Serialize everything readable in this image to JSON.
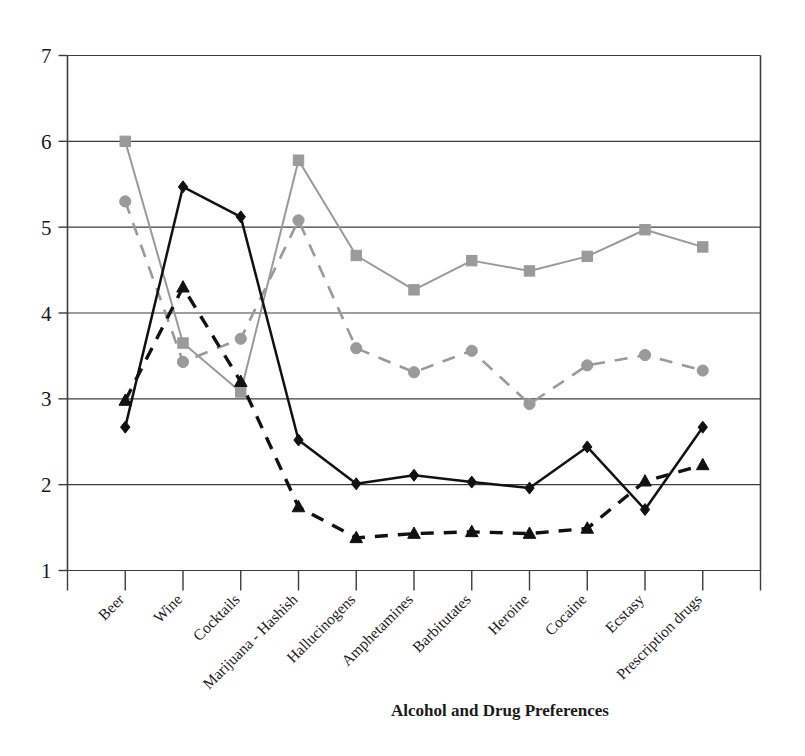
{
  "chart_data": {
    "type": "line",
    "title": "",
    "xlabel": "Alcohol and Drug Preferences",
    "ylabel": "",
    "ylim": [
      1,
      7
    ],
    "yticks": [
      1,
      2,
      3,
      4,
      5,
      6,
      7
    ],
    "grid": true,
    "legend": "none",
    "categories": [
      "Beer",
      "Wine",
      "Cocktails",
      "Marijuana - Hashish",
      "Hallucinogens",
      "Amphetamines",
      "Barbitutates",
      "Heroine",
      "Cocaine",
      "Ecstasy",
      "Prescription drugs"
    ],
    "series": [
      {
        "name": "series-black-solid-diamond",
        "marker": "diamond",
        "linestyle": "solid",
        "color": "#111111",
        "values": [
          2.67,
          5.47,
          5.12,
          2.52,
          2.01,
          2.11,
          2.03,
          1.96,
          2.44,
          1.71,
          2.67
        ]
      },
      {
        "name": "series-black-dashed-triangle",
        "marker": "triangle",
        "linestyle": "dashed",
        "color": "#111111",
        "values": [
          2.98,
          4.3,
          3.2,
          1.74,
          1.38,
          1.43,
          1.45,
          1.43,
          1.49,
          2.04,
          2.23
        ]
      },
      {
        "name": "series-gray-solid-square",
        "marker": "square",
        "linestyle": "solid",
        "color": "#9a9a9a",
        "values": [
          6.0,
          3.65,
          3.08,
          5.78,
          4.67,
          4.27,
          4.61,
          4.49,
          4.66,
          4.97,
          4.77
        ]
      },
      {
        "name": "series-gray-dashed-circle",
        "marker": "circle",
        "linestyle": "dashed",
        "color": "#9a9a9a",
        "values": [
          5.3,
          3.43,
          3.7,
          5.08,
          3.59,
          3.31,
          3.56,
          2.94,
          3.39,
          3.51,
          3.33
        ]
      }
    ]
  },
  "axes": {
    "x_title": "Alcohol and Drug Preferences"
  },
  "colors": {
    "black_series": "#111111",
    "gray_series": "#9a9a9a",
    "axis": "#3c3c3c",
    "background": "#ffffff"
  }
}
